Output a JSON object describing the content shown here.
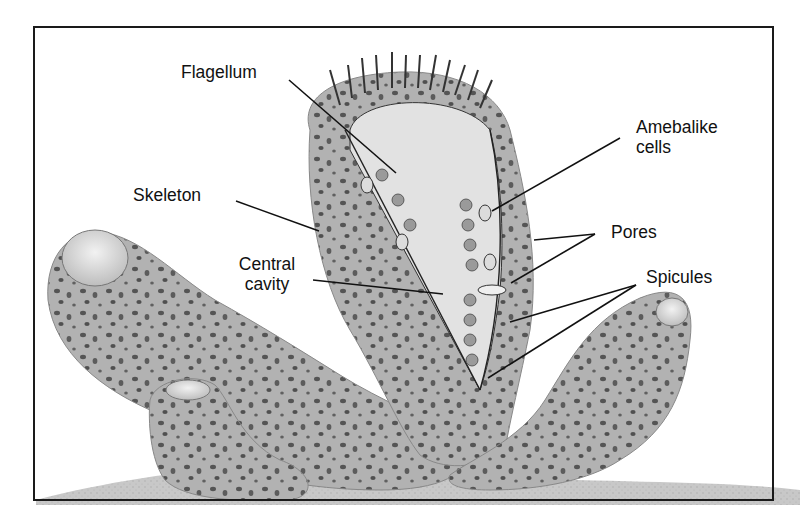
{
  "figure": {
    "colors": {
      "border": "#1a1a1a",
      "body_fill": "#b4b4b4",
      "body_dark": "#8f8f8f",
      "cavity_fill": "#e4e4e4",
      "ground_fill": "#c9c9c9",
      "pore_spot": "#555555",
      "leader_line": "#111111"
    }
  },
  "labels": {
    "flagellum": "Flagellum",
    "skeleton": "Skeleton",
    "central_cavity_line1": "Central",
    "central_cavity_line2": "cavity",
    "amebalike_line1": "Amebalike",
    "amebalike_line2": "cells",
    "pores": "Pores",
    "spicules": "Spicules"
  }
}
